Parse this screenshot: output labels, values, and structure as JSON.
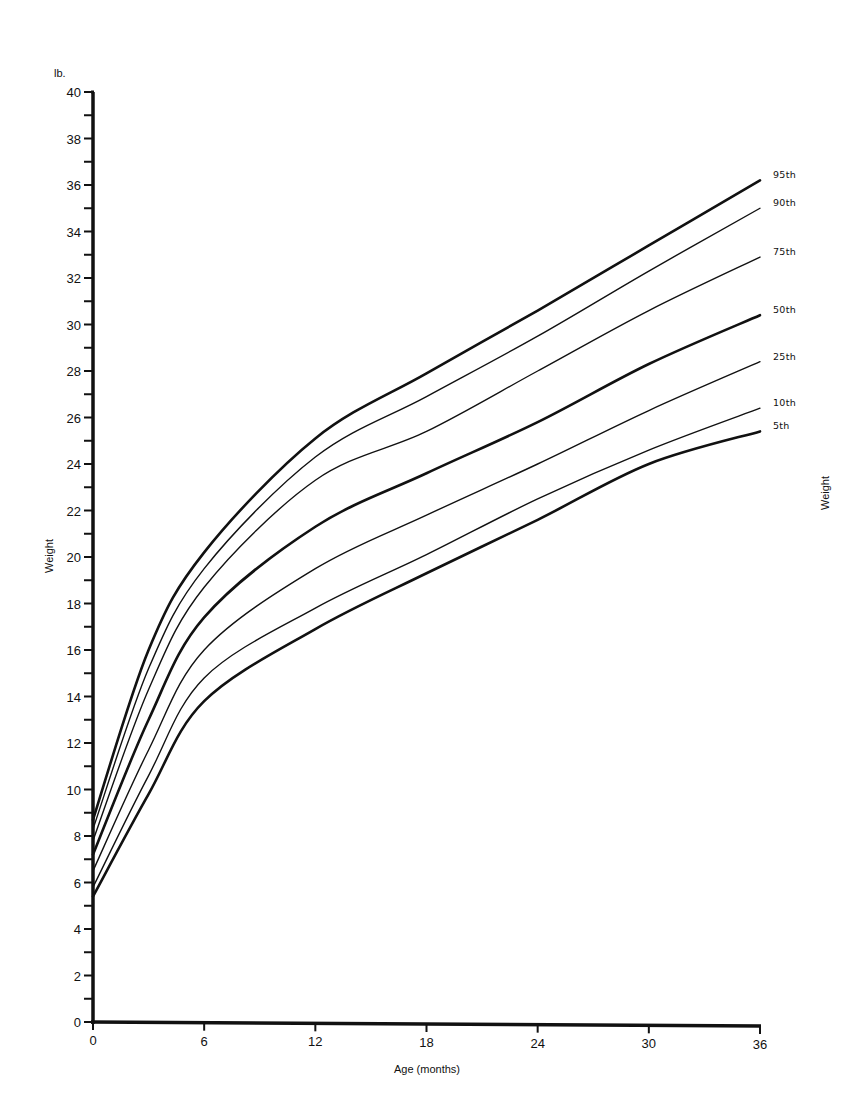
{
  "chart_data": {
    "type": "line",
    "title": "",
    "unit_label": "lb.",
    "xlabel": "Age (months)",
    "ylabel": "Weight",
    "ylabel_right": "Weight",
    "xlim": [
      0,
      36
    ],
    "ylim": [
      0,
      40
    ],
    "x_ticks": [
      0,
      6,
      12,
      18,
      24,
      30,
      36
    ],
    "y_ticks": [
      0,
      2,
      4,
      6,
      8,
      10,
      12,
      14,
      16,
      18,
      20,
      22,
      24,
      26,
      28,
      30,
      32,
      34,
      36,
      38,
      40
    ],
    "y_minor_step": 1,
    "grid": false,
    "legend": "inline labels at right end of each curve",
    "x": [
      0,
      3,
      6,
      12,
      18,
      24,
      30,
      36
    ],
    "series": [
      {
        "name": "95th",
        "weight": "bold",
        "values": [
          8.7,
          16.0,
          20.2,
          25.1,
          27.9,
          30.6,
          33.4,
          36.2
        ]
      },
      {
        "name": "90th",
        "weight": "thin",
        "values": [
          8.3,
          15.2,
          19.5,
          24.3,
          26.9,
          29.5,
          32.3,
          35.0
        ]
      },
      {
        "name": "75th",
        "weight": "thin",
        "values": [
          7.8,
          14.3,
          18.7,
          23.3,
          25.4,
          28.0,
          30.6,
          32.9
        ]
      },
      {
        "name": "50th",
        "weight": "bold",
        "values": [
          7.2,
          13.0,
          17.4,
          21.3,
          23.6,
          25.8,
          28.3,
          30.4
        ]
      },
      {
        "name": "25th",
        "weight": "thin",
        "values": [
          6.5,
          11.7,
          16.0,
          19.5,
          21.8,
          24.0,
          26.3,
          28.4
        ]
      },
      {
        "name": "10th",
        "weight": "thin",
        "values": [
          5.8,
          10.6,
          14.8,
          17.8,
          20.1,
          22.5,
          24.6,
          26.4
        ]
      },
      {
        "name": "5th",
        "weight": "bold",
        "values": [
          5.4,
          9.8,
          13.8,
          16.9,
          19.3,
          21.6,
          24.0,
          25.4
        ]
      }
    ]
  }
}
